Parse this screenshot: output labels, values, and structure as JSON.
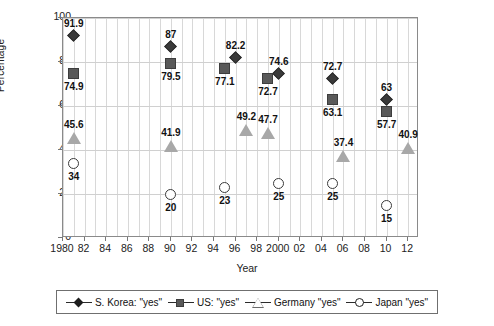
{
  "chart_data": {
    "type": "scatter",
    "title": "",
    "xlabel": "Year",
    "ylabel": "Percentage",
    "xlim": [
      1980,
      2013
    ],
    "ylim": [
      0,
      100
    ],
    "grid": true,
    "legend_position": "bottom",
    "x_ticks": [
      "1980",
      "82",
      "84",
      "86",
      "88",
      "90",
      "92",
      "94",
      "96",
      "98",
      "2000",
      "02",
      "04",
      "06",
      "08",
      "10",
      "12"
    ],
    "x_tick_values": [
      1980,
      1982,
      1984,
      1986,
      1988,
      1990,
      1992,
      1994,
      1996,
      1998,
      2000,
      2002,
      2004,
      2006,
      2008,
      2010,
      2012
    ],
    "y_ticks": [
      "0",
      "20",
      "40",
      "60",
      "80",
      "100"
    ],
    "y_tick_values": [
      0,
      20,
      40,
      60,
      80,
      100
    ],
    "series": [
      {
        "name": "S. Korea: \"yes\"",
        "marker": "diamond",
        "color": "#3a3a3a",
        "points": [
          {
            "x": 1981,
            "y": 91.9,
            "label": "91.9",
            "label_pos": "above"
          },
          {
            "x": 1990,
            "y": 87.0,
            "label": "87",
            "label_pos": "above"
          },
          {
            "x": 1996,
            "y": 82.2,
            "label": "82.2",
            "label_pos": "above"
          },
          {
            "x": 2000,
            "y": 74.6,
            "label": "74.6",
            "label_pos": "above"
          },
          {
            "x": 2005,
            "y": 72.7,
            "label": "72.7",
            "label_pos": "above"
          },
          {
            "x": 2010,
            "y": 63.0,
            "label": "63",
            "label_pos": "above"
          }
        ]
      },
      {
        "name": "US: \"yes\"",
        "marker": "square",
        "color": "#595959",
        "points": [
          {
            "x": 1981,
            "y": 74.9,
            "label": "74.9",
            "label_pos": "below"
          },
          {
            "x": 1990,
            "y": 79.5,
            "label": "79.5",
            "label_pos": "below"
          },
          {
            "x": 1995,
            "y": 77.1,
            "label": "77.1",
            "label_pos": "below"
          },
          {
            "x": 1999,
            "y": 72.7,
            "label": "72.7",
            "label_pos": "below"
          },
          {
            "x": 2005,
            "y": 63.1,
            "label": "63.1",
            "label_pos": "below"
          },
          {
            "x": 2010,
            "y": 57.7,
            "label": "57.7",
            "label_pos": "below"
          }
        ]
      },
      {
        "name": "Germany \"yes\"",
        "marker": "triangle",
        "color": "#a8a8a8",
        "points": [
          {
            "x": 1981,
            "y": 45.6,
            "label": "45.6",
            "label_pos": "above"
          },
          {
            "x": 1990,
            "y": 41.9,
            "label": "41.9",
            "label_pos": "above"
          },
          {
            "x": 1997,
            "y": 49.2,
            "label": "49.2",
            "label_pos": "above"
          },
          {
            "x": 1999,
            "y": 47.7,
            "label": "47.7",
            "label_pos": "above"
          },
          {
            "x": 2006,
            "y": 37.4,
            "label": "37.4",
            "label_pos": "above"
          },
          {
            "x": 2012,
            "y": 40.9,
            "label": "40.9",
            "label_pos": "above"
          }
        ]
      },
      {
        "name": "Japan \"yes\"",
        "marker": "circle",
        "color": "#ffffff",
        "points": [
          {
            "x": 1981,
            "y": 34.0,
            "label": "34",
            "label_pos": "below"
          },
          {
            "x": 1990,
            "y": 20.0,
            "label": "20",
            "label_pos": "below"
          },
          {
            "x": 1995,
            "y": 23.0,
            "label": "23",
            "label_pos": "below"
          },
          {
            "x": 2000,
            "y": 25.0,
            "label": "25",
            "label_pos": "below"
          },
          {
            "x": 2005,
            "y": 25.0,
            "label": "25",
            "label_pos": "below"
          },
          {
            "x": 2010,
            "y": 15.0,
            "label": "15",
            "label_pos": "below"
          }
        ]
      }
    ]
  },
  "legend": {
    "items": [
      {
        "label": "S. Korea: \"yes\"",
        "marker": "diamond"
      },
      {
        "label": "US: \"yes\"",
        "marker": "square"
      },
      {
        "label": "Germany \"yes\"",
        "marker": "triangle"
      },
      {
        "label": "Japan \"yes\"",
        "marker": "circle"
      }
    ]
  }
}
